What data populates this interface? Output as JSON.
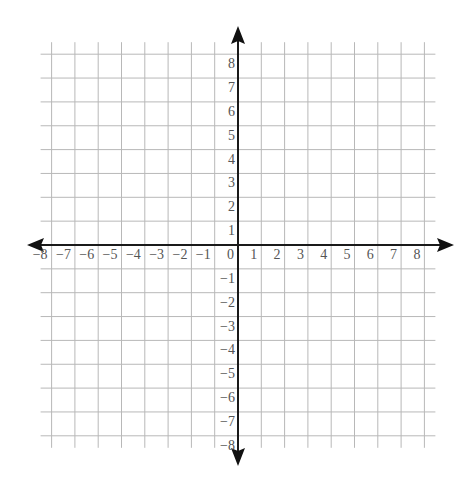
{
  "diagram": {
    "type": "coordinate_plane",
    "title": "",
    "x_axis": {
      "min": -8,
      "max": 8,
      "step": 1,
      "arrows": true,
      "tick_labels": [
        "−8",
        "−7",
        "−6",
        "−5",
        "−4",
        "−3",
        "−2",
        "−1",
        "0",
        "1",
        "2",
        "3",
        "4",
        "5",
        "6",
        "7",
        "8"
      ]
    },
    "y_axis": {
      "min": -8,
      "max": 8,
      "step": 1,
      "arrows": true,
      "tick_labels": [
        "8",
        "7",
        "6",
        "5",
        "4",
        "3",
        "2",
        "1",
        "−1",
        "−2",
        "−3",
        "−4",
        "−5",
        "−6",
        "−7",
        "−8"
      ]
    },
    "grid": true,
    "colors": {
      "grid": "#b8b8b8",
      "axis": "#1a1a1a",
      "labels": "#555555",
      "background": "#ffffff"
    }
  }
}
